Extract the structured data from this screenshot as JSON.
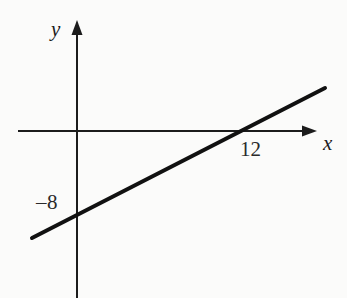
{
  "figure": {
    "background_color": "#fbfbfa",
    "stroke_color": "#1c1c1c",
    "width": 347,
    "height": 298
  },
  "axes": {
    "y_label": "y",
    "x_label": "x",
    "origin": {
      "x": 77,
      "y": 131
    },
    "x_axis": {
      "start_x": 18,
      "end_x": 317,
      "y": 131,
      "arrow": "right"
    },
    "y_axis": {
      "x": 77,
      "top_y": 20,
      "bottom_y": 298,
      "arrow": "up"
    }
  },
  "labels": {
    "x_intercept": "12",
    "y_intercept": "–8"
  },
  "chart_data": {
    "type": "line",
    "title": "",
    "xlabel": "x",
    "ylabel": "y",
    "grid": false,
    "legend": null,
    "annotations": [
      {
        "text": "12",
        "meaning": "x-intercept",
        "x": 12,
        "y": 0
      },
      {
        "text": "–8",
        "meaning": "y-intercept",
        "x": 0,
        "y": -8
      }
    ],
    "series": [
      {
        "name": "line",
        "x": [
          -3.3,
          0,
          12,
          18
        ],
        "y": [
          -10.6,
          -8,
          0,
          4.3
        ],
        "slope": 0.6667,
        "intercept": -8,
        "equation": "y = (2/3)x − 8",
        "x_intercept": 12,
        "y_intercept": -8,
        "pixel_endpoints": [
          {
            "x": 32,
            "y": 238
          },
          {
            "x": 325,
            "y": 88
          }
        ]
      }
    ],
    "xlim": [
      -4.3,
      17.5
    ],
    "ylim": [
      -16.5,
      11
    ]
  }
}
